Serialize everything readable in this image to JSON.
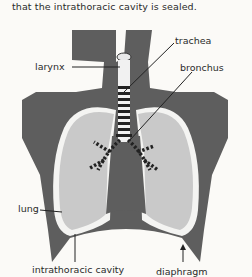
{
  "caption": "that the intrathoracic cavity is sealed.",
  "labels": {
    "larynx": "larynx",
    "trachea": "trachea",
    "bronchus": "bronchus",
    "lung": "lung",
    "cavity": "intrathoracic cavity",
    "diaphragm": "diaphragm"
  },
  "colors": {
    "body": "#5e5e5e",
    "lung": "#c9c9c9",
    "cavity_line": "#f4f4f2",
    "background": "#fbfaf7"
  }
}
